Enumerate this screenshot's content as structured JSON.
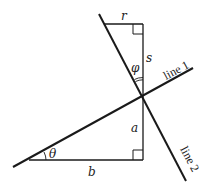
{
  "diagram": {
    "labels": {
      "r": "r",
      "s": "s",
      "phi": "φ",
      "theta": "θ",
      "a": "a",
      "b": "b",
      "line1": "line 1",
      "line2": "line 2"
    },
    "colors": {
      "stroke": "#1a1a1a",
      "background": "#ffffff"
    }
  }
}
